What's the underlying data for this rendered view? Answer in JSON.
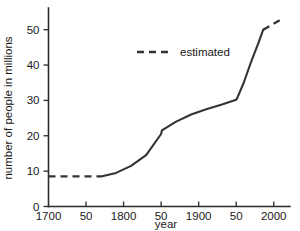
{
  "chart_data": {
    "type": "line",
    "title": "",
    "xlabel": "year",
    "ylabel": "number of people in millions",
    "xlim": [
      1700,
      2015
    ],
    "ylim": [
      0,
      55
    ],
    "grid": false,
    "legend_position": "upper-center",
    "x_tick_values": [
      1700,
      1750,
      1800,
      1850,
      1900,
      1950,
      2000
    ],
    "x_tick_labels": [
      "1700",
      "50",
      "1800",
      "50",
      "1900",
      "50",
      "2000"
    ],
    "y_tick_values": [
      0,
      10,
      20,
      30,
      40,
      50
    ],
    "y_tick_labels": [
      "0",
      "10",
      "20",
      "30",
      "40",
      "50"
    ],
    "series": [
      {
        "name": "estimated",
        "style": "dashed",
        "x": [
          1700,
          1770
        ],
        "y": [
          8.5,
          8.5
        ]
      },
      {
        "name": "recorded",
        "style": "solid",
        "x": [
          1770,
          1790,
          1810,
          1830,
          1850,
          1851,
          1870,
          1890,
          1910,
          1930,
          1950,
          1951,
          1960,
          1970,
          1980,
          1986
        ],
        "y": [
          8.5,
          9.5,
          11.5,
          14.5,
          20.5,
          21.5,
          24.0,
          26.0,
          27.5,
          28.8,
          30.2,
          30.5,
          35.0,
          41.0,
          46.5,
          50.0
        ]
      },
      {
        "name": "estimated-future",
        "style": "dashed",
        "x": [
          1986,
          2012
        ],
        "y": [
          50.0,
          53.2
        ]
      }
    ],
    "legend": [
      {
        "label": "estimated",
        "style": "dashed"
      }
    ]
  },
  "axis": {
    "x_label": "year",
    "y_label": "number of people in millions"
  },
  "legend": {
    "estimated_label": "estimated"
  },
  "ticks": {
    "x": [
      "1700",
      "50",
      "1800",
      "50",
      "1900",
      "50",
      "2000"
    ],
    "y": [
      "0",
      "10",
      "20",
      "30",
      "40",
      "50"
    ]
  },
  "colors": {
    "line": "#333333",
    "axis": "#2b2b2b",
    "background": "#ffffff"
  }
}
